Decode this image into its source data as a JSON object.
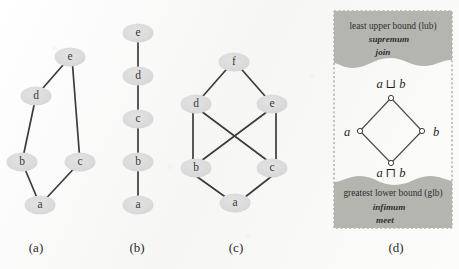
{
  "figure": {
    "background_color": "#f8f8f7",
    "node_fill": "#dcdcdc",
    "edge_color": "#3c3c3c",
    "banner_fill": "#b5b5b0",
    "panels": [
      {
        "id": "a",
        "caption": "(a)",
        "caption_x": 36,
        "caption_y": 252,
        "nodes": [
          {
            "label": "e",
            "x": 70,
            "y": 57
          },
          {
            "label": "d",
            "x": 36,
            "y": 96
          },
          {
            "label": "b",
            "x": 22,
            "y": 162
          },
          {
            "label": "c",
            "x": 80,
            "y": 162
          },
          {
            "label": "a",
            "x": 40,
            "y": 205
          }
        ],
        "edges": [
          {
            "from": "e",
            "to": "d"
          },
          {
            "from": "e",
            "to": "c"
          },
          {
            "from": "d",
            "to": "b"
          },
          {
            "from": "b",
            "to": "a"
          },
          {
            "from": "c",
            "to": "a"
          }
        ]
      },
      {
        "id": "b",
        "caption": "(b)",
        "caption_x": 137,
        "caption_y": 252,
        "nodes": [
          {
            "label": "e",
            "x": 138,
            "y": 33
          },
          {
            "label": "d",
            "x": 138,
            "y": 76
          },
          {
            "label": "c",
            "x": 138,
            "y": 119
          },
          {
            "label": "b",
            "x": 138,
            "y": 162
          },
          {
            "label": "a",
            "x": 138,
            "y": 205
          }
        ],
        "edges": [
          {
            "from": "e",
            "to": "d"
          },
          {
            "from": "d",
            "to": "c"
          },
          {
            "from": "c",
            "to": "b"
          },
          {
            "from": "b",
            "to": "a"
          }
        ]
      },
      {
        "id": "c",
        "caption": "(c)",
        "caption_x": 236,
        "caption_y": 252,
        "nodes": [
          {
            "label": "f",
            "x": 234,
            "y": 62
          },
          {
            "label": "d",
            "x": 196,
            "y": 104
          },
          {
            "label": "e",
            "x": 272,
            "y": 104
          },
          {
            "label": "b",
            "x": 196,
            "y": 168
          },
          {
            "label": "c",
            "x": 272,
            "y": 168
          },
          {
            "label": "a",
            "x": 235,
            "y": 203
          }
        ],
        "edges": [
          {
            "from": "f",
            "to": "d"
          },
          {
            "from": "f",
            "to": "e"
          },
          {
            "from": "d",
            "to": "b"
          },
          {
            "from": "d",
            "to": "c"
          },
          {
            "from": "e",
            "to": "b"
          },
          {
            "from": "e",
            "to": "c"
          },
          {
            "from": "b",
            "to": "a"
          },
          {
            "from": "c",
            "to": "a"
          }
        ]
      }
    ],
    "lattice_panel": {
      "id": "d",
      "caption": "(d)",
      "caption_x": 396,
      "caption_y": 252,
      "top_banner": {
        "line1": "least upper bound (lub)",
        "line2": "supremum",
        "line3": "join"
      },
      "bottom_banner": {
        "line1": "greatest lower bound (glb)",
        "line2": "infimum",
        "line3": "meet"
      },
      "lattice": {
        "top_label": "a ⊔ b",
        "left_label": "a",
        "right_label": "b",
        "bottom_label": "a ⊓ b",
        "vertices": [
          {
            "name": "join",
            "x": 391,
            "y": 98
          },
          {
            "name": "left",
            "x": 360,
            "y": 131
          },
          {
            "name": "right",
            "x": 422,
            "y": 131
          },
          {
            "name": "meet",
            "x": 391,
            "y": 163
          }
        ]
      }
    }
  }
}
